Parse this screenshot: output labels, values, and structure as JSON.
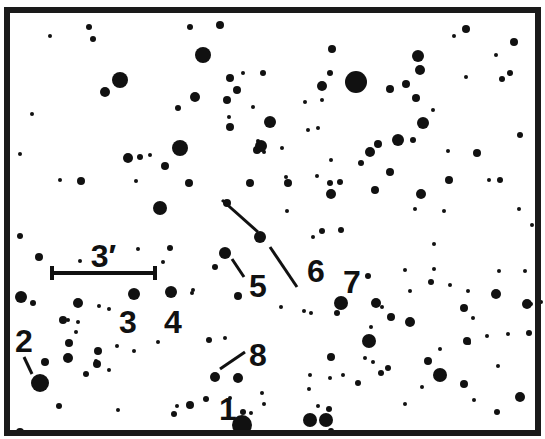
{
  "chart": {
    "frame": {
      "x": 7,
      "y": 10,
      "width": 531,
      "height": 423,
      "stroke": "#1a1a1a",
      "stroke_width": 6
    },
    "colors": {
      "star": "#111111",
      "background": "#ffffff",
      "label": "#111111"
    },
    "scale_bar": {
      "label": "3′",
      "x1": 52,
      "x2": 155,
      "y": 273
    },
    "labels": [
      {
        "id": "1",
        "text": "1",
        "x": 228,
        "y": 420
      },
      {
        "id": "2",
        "text": "2",
        "x": 24,
        "y": 352
      },
      {
        "id": "3",
        "text": "3",
        "x": 128,
        "y": 333
      },
      {
        "id": "4",
        "text": "4",
        "x": 173,
        "y": 333
      },
      {
        "id": "5",
        "text": "5",
        "x": 258,
        "y": 297
      },
      {
        "id": "6",
        "text": "6",
        "x": 316,
        "y": 282
      },
      {
        "id": "7",
        "text": "7",
        "x": 352,
        "y": 293
      },
      {
        "id": "8",
        "text": "8",
        "x": 258,
        "y": 366
      }
    ],
    "pointers": [
      {
        "for": "2",
        "x1": 24,
        "y1": 357,
        "x2": 32,
        "y2": 374
      },
      {
        "for": "5",
        "x1": 232,
        "y1": 259,
        "x2": 244,
        "y2": 277
      },
      {
        "for": "6-upper",
        "x1": 222,
        "y1": 200,
        "x2": 258,
        "y2": 232
      },
      {
        "for": "6-lower",
        "x1": 270,
        "y1": 247,
        "x2": 297,
        "y2": 287
      },
      {
        "for": "8",
        "x1": 220,
        "y1": 369,
        "x2": 245,
        "y2": 352
      }
    ],
    "stars": [
      [
        89,
        27,
        3
      ],
      [
        50,
        36,
        2
      ],
      [
        93,
        39,
        3
      ],
      [
        203,
        55,
        8
      ],
      [
        105,
        92,
        5
      ],
      [
        120,
        80,
        8
      ],
      [
        190,
        27,
        3
      ],
      [
        220,
        25,
        4
      ],
      [
        230,
        78,
        4
      ],
      [
        243,
        73,
        2
      ],
      [
        195,
        97,
        5
      ],
      [
        227,
        100,
        4
      ],
      [
        237,
        90,
        4
      ],
      [
        178,
        108,
        3
      ],
      [
        230,
        127,
        4
      ],
      [
        263,
        73,
        3
      ],
      [
        332,
        49,
        4
      ],
      [
        330,
        73,
        3
      ],
      [
        322,
        86,
        5
      ],
      [
        356,
        82,
        11
      ],
      [
        390,
        89,
        4
      ],
      [
        406,
        84,
        4
      ],
      [
        322,
        100,
        2
      ],
      [
        418,
        56,
        6
      ],
      [
        420,
        70,
        5
      ],
      [
        466,
        29,
        4
      ],
      [
        454,
        36,
        2
      ],
      [
        514,
        42,
        4
      ],
      [
        496,
        55,
        2
      ],
      [
        466,
        77,
        2
      ],
      [
        502,
        79,
        3
      ],
      [
        510,
        73,
        3
      ],
      [
        32,
        114,
        2
      ],
      [
        20,
        154,
        2
      ],
      [
        60,
        180,
        2
      ],
      [
        81,
        181,
        4
      ],
      [
        128,
        158,
        5
      ],
      [
        140,
        157,
        3
      ],
      [
        150,
        155,
        2
      ],
      [
        180,
        148,
        8
      ],
      [
        165,
        166,
        4
      ],
      [
        160,
        208,
        7
      ],
      [
        136,
        181,
        2
      ],
      [
        189,
        183,
        4
      ],
      [
        227,
        203,
        4
      ],
      [
        250,
        183,
        4
      ],
      [
        257,
        150,
        4
      ],
      [
        229,
        117,
        2
      ],
      [
        253,
        107,
        2
      ],
      [
        258,
        141,
        2
      ],
      [
        264,
        152,
        2
      ],
      [
        261,
        146,
        6
      ],
      [
        260,
        237,
        6
      ],
      [
        270,
        122,
        6
      ],
      [
        305,
        102,
        2
      ],
      [
        308,
        130,
        2
      ],
      [
        318,
        128,
        2
      ],
      [
        282,
        148,
        2
      ],
      [
        331,
        160,
        2
      ],
      [
        370,
        152,
        5
      ],
      [
        378,
        144,
        4
      ],
      [
        398,
        140,
        6
      ],
      [
        413,
        140,
        3
      ],
      [
        423,
        123,
        6
      ],
      [
        416,
        98,
        4
      ],
      [
        433,
        110,
        2
      ],
      [
        448,
        151,
        2
      ],
      [
        477,
        153,
        4
      ],
      [
        489,
        180,
        2
      ],
      [
        449,
        180,
        4
      ],
      [
        500,
        180,
        3
      ],
      [
        520,
        135,
        3
      ],
      [
        286,
        177,
        2
      ],
      [
        288,
        183,
        4
      ],
      [
        317,
        176,
        2
      ],
      [
        330,
        183,
        3
      ],
      [
        331,
        194,
        5
      ],
      [
        340,
        182,
        3
      ],
      [
        361,
        163,
        3
      ],
      [
        390,
        172,
        4
      ],
      [
        375,
        190,
        4
      ],
      [
        421,
        194,
        5
      ],
      [
        287,
        211,
        2
      ],
      [
        322,
        231,
        3
      ],
      [
        341,
        230,
        3
      ],
      [
        313,
        237,
        2
      ],
      [
        415,
        209,
        2
      ],
      [
        434,
        244,
        2
      ],
      [
        444,
        211,
        2
      ],
      [
        519,
        209,
        2
      ],
      [
        532,
        225,
        2
      ],
      [
        20,
        236,
        3
      ],
      [
        39,
        257,
        4
      ],
      [
        80,
        261,
        2
      ],
      [
        138,
        249,
        2
      ],
      [
        163,
        262,
        2
      ],
      [
        170,
        248,
        3
      ],
      [
        192,
        293,
        2
      ],
      [
        215,
        267,
        3
      ],
      [
        225,
        253,
        6
      ],
      [
        238,
        296,
        4
      ],
      [
        21,
        297,
        6
      ],
      [
        33,
        303,
        3
      ],
      [
        78,
        303,
        5
      ],
      [
        68,
        320,
        2
      ],
      [
        78,
        322,
        2
      ],
      [
        99,
        306,
        2
      ],
      [
        109,
        309,
        2
      ],
      [
        134,
        294,
        6
      ],
      [
        171,
        292,
        6
      ],
      [
        193,
        290,
        2
      ],
      [
        63,
        320,
        4
      ],
      [
        76,
        332,
        2
      ],
      [
        69,
        343,
        4
      ],
      [
        68,
        358,
        5
      ],
      [
        98,
        351,
        4
      ],
      [
        96,
        361,
        2
      ],
      [
        117,
        346,
        2
      ],
      [
        134,
        351,
        2
      ],
      [
        158,
        342,
        2
      ],
      [
        45,
        362,
        4
      ],
      [
        40,
        383,
        9
      ],
      [
        86,
        374,
        3
      ],
      [
        97,
        364,
        4
      ],
      [
        109,
        370,
        2
      ],
      [
        59,
        406,
        3
      ],
      [
        118,
        410,
        2
      ],
      [
        209,
        340,
        3
      ],
      [
        215,
        377,
        5
      ],
      [
        238,
        378,
        5
      ],
      [
        225,
        338,
        2
      ],
      [
        243,
        412,
        3
      ],
      [
        230,
        398,
        2
      ],
      [
        206,
        399,
        3
      ],
      [
        190,
        405,
        4
      ],
      [
        174,
        414,
        3
      ],
      [
        251,
        413,
        2
      ],
      [
        242,
        425,
        10
      ],
      [
        20,
        432,
        4
      ],
      [
        177,
        406,
        2
      ],
      [
        262,
        393,
        2
      ],
      [
        264,
        404,
        2
      ],
      [
        318,
        406,
        2
      ],
      [
        281,
        307,
        2
      ],
      [
        304,
        311,
        2
      ],
      [
        311,
        313,
        2
      ],
      [
        341,
        303,
        7
      ],
      [
        376,
        303,
        5
      ],
      [
        382,
        307,
        2
      ],
      [
        391,
        317,
        4
      ],
      [
        410,
        322,
        5
      ],
      [
        337,
        313,
        3
      ],
      [
        367,
        338,
        2
      ],
      [
        369,
        341,
        7
      ],
      [
        371,
        327,
        2
      ],
      [
        365,
        358,
        2
      ],
      [
        373,
        362,
        2
      ],
      [
        331,
        357,
        4
      ],
      [
        343,
        375,
        2
      ],
      [
        330,
        378,
        2
      ],
      [
        358,
        383,
        3
      ],
      [
        310,
        375,
        2
      ],
      [
        309,
        389,
        2
      ],
      [
        329,
        409,
        3
      ],
      [
        326,
        420,
        7
      ],
      [
        381,
        373,
        3
      ],
      [
        388,
        368,
        3
      ],
      [
        440,
        375,
        7
      ],
      [
        428,
        361,
        4
      ],
      [
        464,
        384,
        4
      ],
      [
        405,
        404,
        2
      ],
      [
        422,
        387,
        2
      ],
      [
        508,
        334,
        2
      ],
      [
        529,
        333,
        3
      ],
      [
        527,
        304,
        5
      ],
      [
        473,
        318,
        2
      ],
      [
        467,
        341,
        4
      ],
      [
        469,
        343,
        2
      ],
      [
        487,
        336,
        2
      ],
      [
        498,
        366,
        2
      ],
      [
        464,
        308,
        4
      ],
      [
        440,
        349,
        2
      ],
      [
        474,
        400,
        2
      ],
      [
        497,
        412,
        3
      ],
      [
        520,
        397,
        5
      ],
      [
        405,
        270,
        2
      ],
      [
        368,
        276,
        3
      ],
      [
        450,
        285,
        2
      ],
      [
        468,
        291,
        2
      ],
      [
        531,
        304,
        2
      ],
      [
        434,
        269,
        2
      ],
      [
        499,
        271,
        2
      ],
      [
        525,
        271,
        2
      ],
      [
        431,
        282,
        3
      ],
      [
        410,
        291,
        2
      ],
      [
        496,
        294,
        5
      ],
      [
        541,
        302,
        2
      ],
      [
        310,
        420,
        7
      ],
      [
        331,
        431,
        3
      ]
    ]
  }
}
